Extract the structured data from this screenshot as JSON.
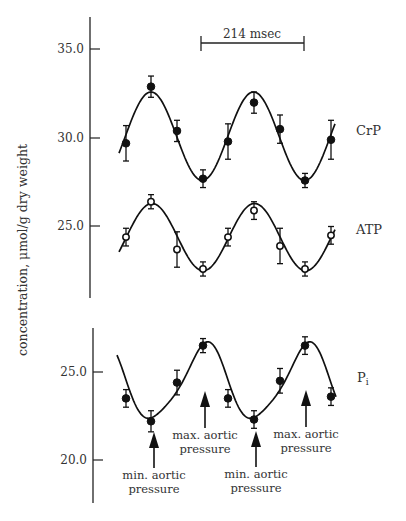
{
  "chart_data": {
    "type": "scatter",
    "title": "",
    "xlabel": "",
    "ylabel": "concentration, μmol/g dry weight",
    "scale_bar": {
      "label": "214 msec"
    },
    "panels": [
      {
        "name": "top",
        "yticks": [
          35.0,
          30.0,
          25.0
        ],
        "ytick_labels": [
          "35.0",
          "30.0",
          "25.0"
        ],
        "series": [
          {
            "name": "CrP",
            "marker": "filled-circle",
            "values": [
              29.7,
              32.9,
              30.4,
              27.7,
              29.8,
              32.0,
              30.5,
              27.6,
              29.9
            ],
            "errors": [
              1.0,
              0.6,
              0.6,
              0.5,
              1.0,
              0.6,
              0.8,
              0.4,
              1.1
            ]
          },
          {
            "name": "ATP",
            "marker": "open-circle",
            "values": [
              24.4,
              26.4,
              23.7,
              22.6,
              24.4,
              25.9,
              23.9,
              22.6,
              24.5
            ],
            "errors": [
              0.5,
              0.4,
              1.0,
              0.4,
              0.5,
              0.5,
              1.0,
              0.4,
              0.5
            ]
          }
        ]
      },
      {
        "name": "bottom",
        "yticks": [
          25.0,
          20.0
        ],
        "ytick_labels": [
          "25.0",
          "20.0"
        ],
        "series": [
          {
            "name": "Pᵢ",
            "marker": "filled-circle",
            "values": [
              23.5,
              22.2,
              24.4,
              26.5,
              23.5,
              22.3,
              24.5,
              26.5,
              23.6
            ],
            "errors": [
              0.5,
              0.6,
              0.7,
              0.4,
              0.5,
              0.5,
              0.7,
              0.5,
              0.5
            ]
          }
        ]
      }
    ],
    "annotations": [
      {
        "line1": "min. aortic",
        "line2": "pressure",
        "at_index": 1
      },
      {
        "line1": "max. aortic",
        "line2": "pressure",
        "at_index": 3
      },
      {
        "line1": "min. aortic",
        "line2": "pressure",
        "at_index": 5
      },
      {
        "line1": "max. aortic",
        "line2": "pressure",
        "at_index": 7
      }
    ]
  },
  "labels": {
    "ylabel": "concentration, μmol/g dry weight",
    "scale_bar": "214 msec",
    "crp": "CrP",
    "atp": "ATP",
    "pi_main": "P",
    "pi_sub": "i",
    "top_ticks": [
      "35.0",
      "30.0",
      "25.0"
    ],
    "bottom_ticks": [
      "25.0",
      "20.0"
    ],
    "anno": [
      {
        "l1": "min. aortic",
        "l2": "pressure"
      },
      {
        "l1": "max. aortic",
        "l2": "pressure"
      },
      {
        "l1": "min. aortic",
        "l2": "pressure"
      },
      {
        "l1": "max. aortic",
        "l2": "pressure"
      }
    ]
  }
}
